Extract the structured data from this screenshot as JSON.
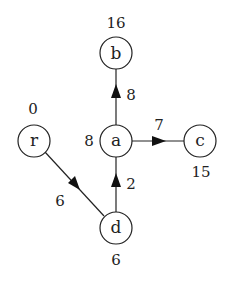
{
  "diagram": {
    "type": "shortest-path-tree",
    "nodes": [
      {
        "id": "b",
        "label": "b",
        "distance": "16",
        "x": 116,
        "y": 53
      },
      {
        "id": "r",
        "label": "r",
        "distance": "0",
        "x": 34,
        "y": 141
      },
      {
        "id": "a",
        "label": "a",
        "distance": "8",
        "x": 116,
        "y": 141
      },
      {
        "id": "c",
        "label": "c",
        "distance": "15",
        "x": 200,
        "y": 141
      },
      {
        "id": "d",
        "label": "d",
        "distance": "6",
        "x": 116,
        "y": 228
      }
    ],
    "edges": [
      {
        "from": "a",
        "to": "b",
        "weight": "8"
      },
      {
        "from": "a",
        "to": "c",
        "weight": "7"
      },
      {
        "from": "d",
        "to": "a",
        "weight": "2"
      },
      {
        "from": "r",
        "to": "d",
        "weight": "6"
      }
    ]
  }
}
